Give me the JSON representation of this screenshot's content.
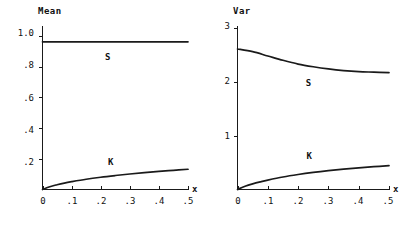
{
  "chart_data": [
    {
      "type": "line",
      "title": "Mean",
      "panel_id": "mean",
      "xlabel": "x",
      "ylabel": "Mean",
      "xlim": [
        0,
        0.5
      ],
      "ylim": [
        0,
        1.08
      ],
      "grid": false,
      "legend": "inline-labels",
      "xticks": [
        0,
        0.1,
        0.2,
        0.3,
        0.4,
        0.5
      ],
      "xticklabels": [
        "0",
        ".1",
        ".2",
        ".3",
        ".4",
        ".5"
      ],
      "yticks": [
        0.2,
        0.4,
        0.6,
        0.8,
        1.0
      ],
      "yticklabels": [
        ".2",
        ".4",
        ".6",
        ".8",
        "1.0"
      ],
      "series": [
        {
          "name": "S",
          "label": "S",
          "label_x": 0.215,
          "label_y": 0.855,
          "x": [
            0.0,
            0.05,
            0.1,
            0.15,
            0.2,
            0.25,
            0.3,
            0.35,
            0.4,
            0.45,
            0.5
          ],
          "values": [
            0.962,
            0.962,
            0.962,
            0.962,
            0.962,
            0.962,
            0.962,
            0.962,
            0.962,
            0.962,
            0.962
          ]
        },
        {
          "name": "K",
          "label": "K",
          "label_x": 0.225,
          "label_y": 0.176,
          "x": [
            0.0,
            0.025,
            0.05,
            0.075,
            0.1,
            0.15,
            0.2,
            0.25,
            0.3,
            0.35,
            0.4,
            0.45,
            0.5
          ],
          "values": [
            0.0,
            0.018,
            0.031,
            0.042,
            0.051,
            0.067,
            0.08,
            0.091,
            0.101,
            0.11,
            0.118,
            0.125,
            0.132
          ]
        }
      ]
    },
    {
      "type": "line",
      "title": "Var",
      "panel_id": "var",
      "xlabel": "x",
      "ylabel": "Var",
      "xlim": [
        0,
        0.5
      ],
      "ylim": [
        0,
        3.25
      ],
      "grid": false,
      "legend": "inline-labels",
      "xticks": [
        0,
        0.1,
        0.2,
        0.3,
        0.4,
        0.5
      ],
      "xticklabels": [
        "0",
        ".1",
        ".2",
        ".3",
        ".4",
        ".5"
      ],
      "yticks": [
        1,
        2,
        3
      ],
      "yticklabels": [
        "1",
        "2",
        "3"
      ],
      "series": [
        {
          "name": "S",
          "label": "S",
          "label_x": 0.225,
          "label_y": 1.96,
          "x": [
            0.0,
            0.05,
            0.1,
            0.15,
            0.2,
            0.25,
            0.3,
            0.35,
            0.4,
            0.45,
            0.5
          ],
          "values": [
            2.61,
            2.56,
            2.48,
            2.4,
            2.33,
            2.28,
            2.24,
            2.21,
            2.19,
            2.18,
            2.17
          ]
        },
        {
          "name": "K",
          "label": "K",
          "label_x": 0.228,
          "label_y": 0.6,
          "x": [
            0.0,
            0.025,
            0.05,
            0.075,
            0.1,
            0.15,
            0.2,
            0.25,
            0.3,
            0.35,
            0.4,
            0.45,
            0.5
          ],
          "values": [
            0.0,
            0.06,
            0.105,
            0.142,
            0.175,
            0.232,
            0.278,
            0.317,
            0.35,
            0.378,
            0.403,
            0.424,
            0.443
          ]
        }
      ]
    }
  ],
  "panels": {
    "mean": {
      "axis_title": "Mean",
      "xaxis_name": "x",
      "curve_labels": {
        "s": "S",
        "k": "K"
      },
      "ytick_labels": [
        "1.0",
        ".8",
        ".6",
        ".4",
        ".2"
      ],
      "xtick_labels": [
        "0",
        ".1",
        ".2",
        ".3",
        ".4",
        ".5"
      ]
    },
    "var": {
      "axis_title": "Var",
      "xaxis_name": "x",
      "curve_labels": {
        "s": "S",
        "k": "K"
      },
      "ytick_labels": [
        "3",
        "2",
        "1"
      ],
      "xtick_labels": [
        "0",
        ".1",
        ".2",
        ".3",
        ".4",
        ".5"
      ]
    }
  },
  "colors": {
    "ink": "#1a1a1a",
    "background": "#ffffff"
  }
}
